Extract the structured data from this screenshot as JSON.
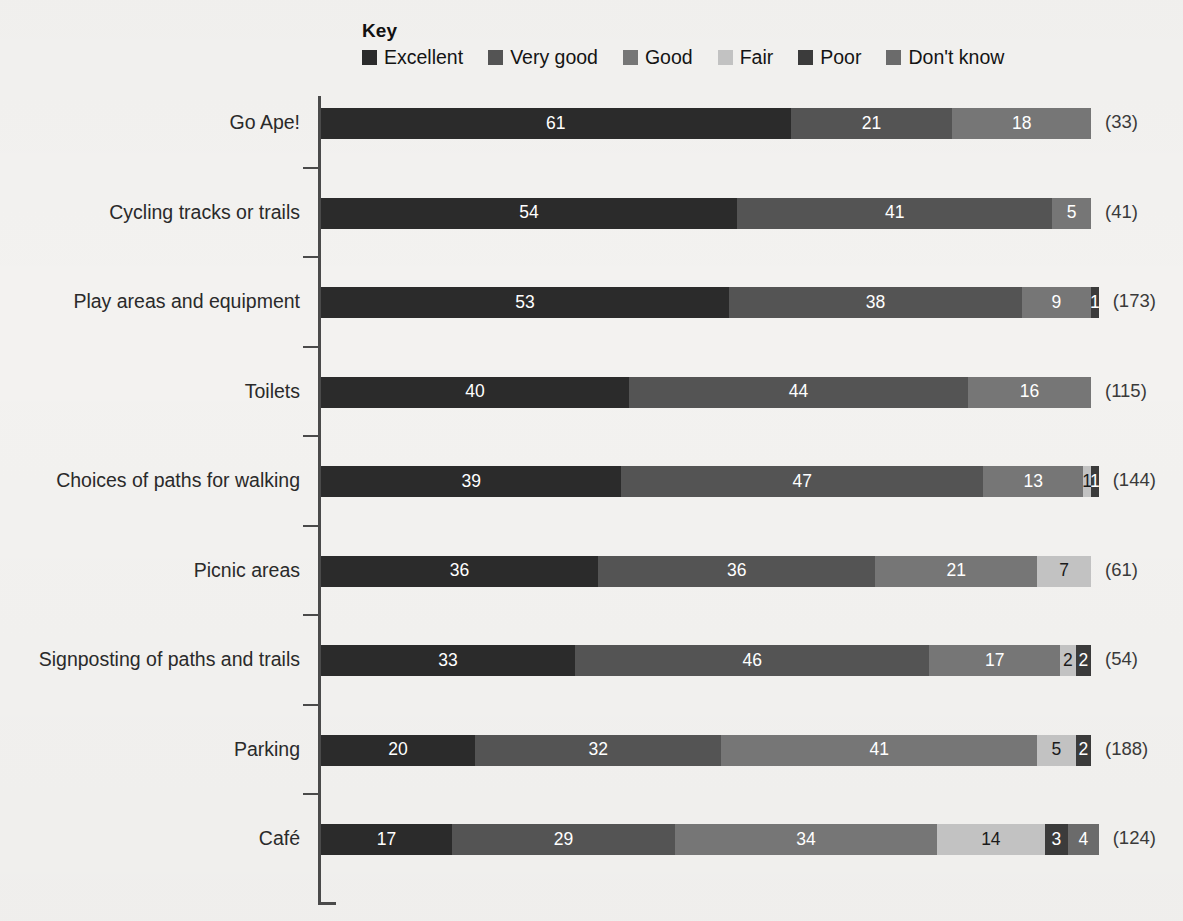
{
  "legend": {
    "title": "Key",
    "items": [
      {
        "label": "Excellent",
        "color": "#2b2b2b",
        "icon": "legend-swatch-icon"
      },
      {
        "label": "Very good",
        "color": "#545454",
        "icon": "legend-swatch-icon"
      },
      {
        "label": "Good",
        "color": "#767676",
        "icon": "legend-swatch-icon"
      },
      {
        "label": "Fair",
        "color": "#c2c2c2",
        "icon": "legend-swatch-icon"
      },
      {
        "label": "Poor",
        "color": "#3b3b3b",
        "icon": "legend-swatch-icon"
      },
      {
        "label": "Don't know",
        "color": "#6b6b6b",
        "icon": "legend-swatch-icon"
      }
    ]
  },
  "chart_data": {
    "type": "bar",
    "orientation": "horizontal",
    "stacked": true,
    "normalized_percent": true,
    "title": "",
    "xlabel": "",
    "ylabel": "",
    "xlim": [
      0,
      100
    ],
    "grid": false,
    "legend_position": "top",
    "series": [
      {
        "name": "Excellent",
        "color": "#2b2b2b",
        "values": [
          61,
          54,
          53,
          40,
          39,
          36,
          33,
          20,
          17
        ]
      },
      {
        "name": "Very good",
        "color": "#545454",
        "values": [
          21,
          41,
          38,
          44,
          47,
          36,
          46,
          32,
          29
        ]
      },
      {
        "name": "Good",
        "color": "#767676",
        "values": [
          18,
          5,
          9,
          16,
          13,
          21,
          17,
          41,
          34
        ]
      },
      {
        "name": "Fair",
        "color": "#c2c2c2",
        "values": [
          0,
          0,
          0,
          0,
          1,
          7,
          2,
          5,
          14
        ]
      },
      {
        "name": "Poor",
        "color": "#3b3b3b",
        "values": [
          0,
          0,
          1,
          0,
          1,
          0,
          2,
          2,
          3
        ]
      },
      {
        "name": "Don't know",
        "color": "#6b6b6b",
        "values": [
          0,
          0,
          0,
          0,
          0,
          0,
          0,
          0,
          4
        ]
      }
    ],
    "categories": [
      "Go Ape!",
      "Cycling tracks or trails",
      "Play areas and equipment",
      "Toilets",
      "Choices of paths for walking",
      "Picnic areas",
      "Signposting of paths and trails",
      "Parking",
      "Café"
    ],
    "base_counts": [
      33,
      41,
      173,
      115,
      144,
      61,
      54,
      188,
      124
    ],
    "base_count_labels": [
      "(33)",
      "(41)",
      "(173)",
      "(115)",
      "(144)",
      "(61)",
      "(54)",
      "(188)",
      "(124)"
    ]
  },
  "rows": [
    {
      "label": "Go Ape!",
      "total": "(33)",
      "segments": [
        {
          "series": "Excellent",
          "value": 61,
          "text": "61",
          "color": "#2b2b2b",
          "text_color": "#ffffff"
        },
        {
          "series": "Very good",
          "value": 21,
          "text": "21",
          "color": "#545454",
          "text_color": "#ffffff"
        },
        {
          "series": "Good",
          "value": 18,
          "text": "18",
          "color": "#767676",
          "text_color": "#ffffff"
        }
      ]
    },
    {
      "label": "Cycling tracks or trails",
      "total": "(41)",
      "segments": [
        {
          "series": "Excellent",
          "value": 54,
          "text": "54",
          "color": "#2b2b2b",
          "text_color": "#ffffff"
        },
        {
          "series": "Very good",
          "value": 41,
          "text": "41",
          "color": "#545454",
          "text_color": "#ffffff"
        },
        {
          "series": "Good",
          "value": 5,
          "text": "5",
          "color": "#767676",
          "text_color": "#ffffff"
        }
      ]
    },
    {
      "label": "Play areas and equipment",
      "total": "(173)",
      "segments": [
        {
          "series": "Excellent",
          "value": 53,
          "text": "53",
          "color": "#2b2b2b",
          "text_color": "#ffffff"
        },
        {
          "series": "Very good",
          "value": 38,
          "text": "38",
          "color": "#545454",
          "text_color": "#ffffff"
        },
        {
          "series": "Good",
          "value": 9,
          "text": "9",
          "color": "#767676",
          "text_color": "#ffffff"
        },
        {
          "series": "Poor",
          "value": 1,
          "text": "1",
          "color": "#3b3b3b",
          "text_color": "#ffffff"
        }
      ]
    },
    {
      "label": "Toilets",
      "total": "(115)",
      "segments": [
        {
          "series": "Excellent",
          "value": 40,
          "text": "40",
          "color": "#2b2b2b",
          "text_color": "#ffffff"
        },
        {
          "series": "Very good",
          "value": 44,
          "text": "44",
          "color": "#545454",
          "text_color": "#ffffff"
        },
        {
          "series": "Good",
          "value": 16,
          "text": "16",
          "color": "#767676",
          "text_color": "#ffffff"
        }
      ]
    },
    {
      "label": "Choices of paths for walking",
      "total": "(144)",
      "segments": [
        {
          "series": "Excellent",
          "value": 39,
          "text": "39",
          "color": "#2b2b2b",
          "text_color": "#ffffff"
        },
        {
          "series": "Very good",
          "value": 47,
          "text": "47",
          "color": "#545454",
          "text_color": "#ffffff"
        },
        {
          "series": "Good",
          "value": 13,
          "text": "13",
          "color": "#767676",
          "text_color": "#ffffff"
        },
        {
          "series": "Fair",
          "value": 1,
          "text": "1",
          "color": "#c2c2c2",
          "text_color": "#1a1a1a"
        },
        {
          "series": "Poor",
          "value": 1,
          "text": "1",
          "color": "#3b3b3b",
          "text_color": "#ffffff"
        }
      ]
    },
    {
      "label": "Picnic areas",
      "total": "(61)",
      "segments": [
        {
          "series": "Excellent",
          "value": 36,
          "text": "36",
          "color": "#2b2b2b",
          "text_color": "#ffffff"
        },
        {
          "series": "Very good",
          "value": 36,
          "text": "36",
          "color": "#545454",
          "text_color": "#ffffff"
        },
        {
          "series": "Good",
          "value": 21,
          "text": "21",
          "color": "#767676",
          "text_color": "#ffffff"
        },
        {
          "series": "Fair",
          "value": 7,
          "text": "7",
          "color": "#c2c2c2",
          "text_color": "#1a1a1a"
        }
      ]
    },
    {
      "label": "Signposting of paths and trails",
      "total": "(54)",
      "segments": [
        {
          "series": "Excellent",
          "value": 33,
          "text": "33",
          "color": "#2b2b2b",
          "text_color": "#ffffff"
        },
        {
          "series": "Very good",
          "value": 46,
          "text": "46",
          "color": "#545454",
          "text_color": "#ffffff"
        },
        {
          "series": "Good",
          "value": 17,
          "text": "17",
          "color": "#767676",
          "text_color": "#ffffff"
        },
        {
          "series": "Fair",
          "value": 2,
          "text": "2",
          "color": "#c2c2c2",
          "text_color": "#1a1a1a"
        },
        {
          "series": "Poor",
          "value": 2,
          "text": "2",
          "color": "#3b3b3b",
          "text_color": "#ffffff"
        }
      ]
    },
    {
      "label": "Parking",
      "total": "(188)",
      "segments": [
        {
          "series": "Excellent",
          "value": 20,
          "text": "20",
          "color": "#2b2b2b",
          "text_color": "#ffffff"
        },
        {
          "series": "Very good",
          "value": 32,
          "text": "32",
          "color": "#545454",
          "text_color": "#ffffff"
        },
        {
          "series": "Good",
          "value": 41,
          "text": "41",
          "color": "#767676",
          "text_color": "#ffffff"
        },
        {
          "series": "Fair",
          "value": 5,
          "text": "5",
          "color": "#c2c2c2",
          "text_color": "#1a1a1a"
        },
        {
          "series": "Poor",
          "value": 2,
          "text": "2",
          "color": "#3b3b3b",
          "text_color": "#ffffff"
        }
      ]
    },
    {
      "label": "Café",
      "total": "(124)",
      "segments": [
        {
          "series": "Excellent",
          "value": 17,
          "text": "17",
          "color": "#2b2b2b",
          "text_color": "#ffffff"
        },
        {
          "series": "Very good",
          "value": 29,
          "text": "29",
          "color": "#545454",
          "text_color": "#ffffff"
        },
        {
          "series": "Good",
          "value": 34,
          "text": "34",
          "color": "#767676",
          "text_color": "#ffffff"
        },
        {
          "series": "Fair",
          "value": 14,
          "text": "14",
          "color": "#c2c2c2",
          "text_color": "#1a1a1a"
        },
        {
          "series": "Poor",
          "value": 3,
          "text": "3",
          "color": "#3b3b3b",
          "text_color": "#ffffff"
        },
        {
          "series": "Don't know",
          "value": 4,
          "text": "4",
          "color": "#6b6b6b",
          "text_color": "#ffffff"
        }
      ]
    }
  ],
  "axis": {
    "color": "#4a4a4a",
    "tick_count": 9
  }
}
